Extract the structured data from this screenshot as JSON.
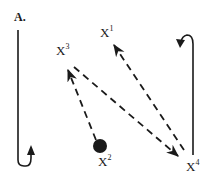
{
  "panel": {
    "label": "A."
  },
  "nodes": [
    {
      "id": "X1",
      "base": "X",
      "sup": "1",
      "x": 104,
      "y": 30
    },
    {
      "id": "X2",
      "base": "X",
      "sup": "2",
      "x": 98,
      "y": 147,
      "marker": "filled-circle"
    },
    {
      "id": "X3",
      "base": "X",
      "sup": "3",
      "x": 58,
      "y": 45
    },
    {
      "id": "X4",
      "base": "X",
      "sup": "4",
      "x": 187,
      "y": 162
    }
  ],
  "edges": [
    {
      "from": "X2",
      "to": "X3",
      "style": "dashed",
      "arrow": "to"
    },
    {
      "from": "X3",
      "to": "X4",
      "style": "dashed",
      "arrow": "to"
    },
    {
      "from": "X4",
      "to": "X1",
      "style": "dashed",
      "arrow": "to"
    }
  ],
  "side_arrows": [
    {
      "name": "left-down-up-hook-arrow",
      "direction": "down-then-up"
    },
    {
      "name": "right-up-hook-arrow",
      "direction": "up-then-left"
    }
  ],
  "colors": {
    "ink": "#1a1a1a",
    "background": "#ffffff"
  }
}
